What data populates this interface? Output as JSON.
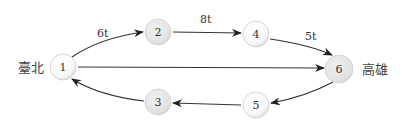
{
  "diagram": {
    "cities": {
      "start": "臺北",
      "end": "高雄"
    },
    "nodes": [
      {
        "id": "1",
        "label": "1",
        "x": 63,
        "y": 67,
        "fill": "#ffffff"
      },
      {
        "id": "2",
        "label": "2",
        "x": 158,
        "y": 32,
        "fill": "#e6e6e6"
      },
      {
        "id": "4",
        "label": "4",
        "x": 256,
        "y": 34,
        "fill": "#ffffff"
      },
      {
        "id": "6",
        "label": "6",
        "x": 339,
        "y": 69,
        "fill": "#e6e6e6"
      },
      {
        "id": "5",
        "label": "5",
        "x": 256,
        "y": 105,
        "fill": "#ffffff"
      },
      {
        "id": "3",
        "label": "3",
        "x": 158,
        "y": 102,
        "fill": "#e6e6e6"
      }
    ],
    "edges": [
      {
        "from": "1",
        "to": "2",
        "label": "6t"
      },
      {
        "from": "2",
        "to": "4",
        "label": "8t"
      },
      {
        "from": "4",
        "to": "6",
        "label": "5t"
      },
      {
        "from": "1",
        "to": "6",
        "label": ""
      },
      {
        "from": "6",
        "to": "5",
        "label": ""
      },
      {
        "from": "5",
        "to": "3",
        "label": ""
      },
      {
        "from": "3",
        "to": "1",
        "label": ""
      }
    ]
  }
}
